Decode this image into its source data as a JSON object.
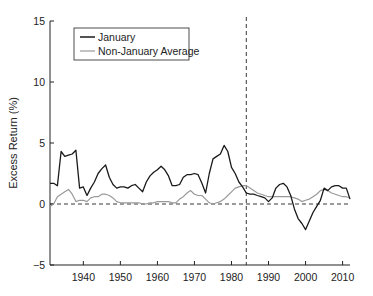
{
  "chart_data": {
    "type": "line",
    "title": "",
    "xlabel": "",
    "ylabel": "Excess Return (%)",
    "xlim": [
      1931,
      2012
    ],
    "ylim": [
      -5,
      15
    ],
    "xticks": [
      1940,
      1950,
      1960,
      1970,
      1980,
      1990,
      2000,
      2010
    ],
    "yticks": [
      -5,
      0,
      5,
      10,
      15
    ],
    "grid": false,
    "legend_position": "upper left",
    "reference_lines": [
      {
        "type": "horizontal",
        "value": 0,
        "style": "dashed"
      },
      {
        "type": "vertical",
        "value": 1984,
        "style": "dashed"
      }
    ],
    "series": [
      {
        "name": "January",
        "color": "#1a1a1a",
        "x": [
          1931,
          1932,
          1933,
          1934,
          1935,
          1936,
          1937,
          1938,
          1939,
          1940,
          1941,
          1942,
          1943,
          1944,
          1945,
          1946,
          1947,
          1948,
          1949,
          1950,
          1951,
          1952,
          1953,
          1954,
          1955,
          1956,
          1957,
          1958,
          1959,
          1960,
          1961,
          1962,
          1963,
          1964,
          1965,
          1966,
          1967,
          1968,
          1969,
          1970,
          1971,
          1972,
          1973,
          1974,
          1975,
          1976,
          1977,
          1978,
          1979,
          1980,
          1981,
          1982,
          1983,
          1984,
          1985,
          1986,
          1987,
          1988,
          1989,
          1990,
          1991,
          1992,
          1993,
          1994,
          1995,
          1996,
          1997,
          1998,
          1999,
          2000,
          2001,
          2002,
          2003,
          2004,
          2005,
          2006,
          2007,
          2008,
          2009,
          2010,
          2011,
          2012
        ],
        "values": [
          1.7,
          1.7,
          1.5,
          4.3,
          3.9,
          4.0,
          4.1,
          4.4,
          1.3,
          1.4,
          0.7,
          1.3,
          1.8,
          2.5,
          2.9,
          3.2,
          2.2,
          1.6,
          1.3,
          1.4,
          1.4,
          1.3,
          1.5,
          1.6,
          1.3,
          1.0,
          1.8,
          2.3,
          2.6,
          2.8,
          3.1,
          2.8,
          2.3,
          1.5,
          1.5,
          1.6,
          2.2,
          2.4,
          2.4,
          2.5,
          2.4,
          1.7,
          0.9,
          2.5,
          3.7,
          3.9,
          4.1,
          4.8,
          4.3,
          3.0,
          2.5,
          1.8,
          1.4,
          0.9,
          0.8,
          0.8,
          0.7,
          0.6,
          0.5,
          0.2,
          0.5,
          1.3,
          1.6,
          1.7,
          1.4,
          0.7,
          -0.4,
          -1.2,
          -1.6,
          -2.1,
          -1.4,
          -0.7,
          -0.2,
          0.3,
          1.3,
          1.1,
          1.4,
          1.5,
          1.5,
          1.3,
          1.3,
          0.4
        ]
      },
      {
        "name": "Non-January Average",
        "color": "#999999",
        "x": [
          1931,
          1932,
          1933,
          1934,
          1935,
          1936,
          1937,
          1938,
          1939,
          1940,
          1941,
          1942,
          1943,
          1944,
          1945,
          1946,
          1947,
          1948,
          1949,
          1950,
          1951,
          1952,
          1953,
          1954,
          1955,
          1956,
          1957,
          1958,
          1959,
          1960,
          1961,
          1962,
          1963,
          1964,
          1965,
          1966,
          1967,
          1968,
          1969,
          1970,
          1971,
          1972,
          1973,
          1974,
          1975,
          1976,
          1977,
          1978,
          1979,
          1980,
          1981,
          1982,
          1983,
          1984,
          1985,
          1986,
          1987,
          1988,
          1989,
          1990,
          1991,
          1992,
          1993,
          1994,
          1995,
          1996,
          1997,
          1998,
          1999,
          2000,
          2001,
          2002,
          2003,
          2004,
          2005,
          2006,
          2007,
          2008,
          2009,
          2010,
          2011,
          2012
        ],
        "values": [
          -0.2,
          0.0,
          0.6,
          0.8,
          1.0,
          1.2,
          0.8,
          0.2,
          0.3,
          0.3,
          0.2,
          0.5,
          0.6,
          0.6,
          0.8,
          0.8,
          0.7,
          0.5,
          0.2,
          0.1,
          0.1,
          0.1,
          0.1,
          0.1,
          0.1,
          0.0,
          0.0,
          0.1,
          0.1,
          0.2,
          0.2,
          0.2,
          0.2,
          0.1,
          0.1,
          0.4,
          0.6,
          0.9,
          1.1,
          0.8,
          0.7,
          0.7,
          0.4,
          0.1,
          0.0,
          0.1,
          0.2,
          0.4,
          0.7,
          1.0,
          1.3,
          1.4,
          1.5,
          1.5,
          1.3,
          1.1,
          0.9,
          0.8,
          0.7,
          0.6,
          0.6,
          0.6,
          0.6,
          0.6,
          0.6,
          0.6,
          0.5,
          0.4,
          0.2,
          0.3,
          0.4,
          0.6,
          0.8,
          1.1,
          1.2,
          1.1,
          0.9,
          0.8,
          0.7,
          0.6,
          0.6,
          0.5
        ]
      }
    ]
  },
  "legend": {
    "items": [
      {
        "label": "January",
        "color": "#1a1a1a"
      },
      {
        "label": "Non-January Average",
        "color": "#999999"
      }
    ]
  },
  "axes": {
    "y_title": "Excess Return (%)",
    "y_tick_labels": [
      "15",
      "10",
      "5",
      "0",
      "−5"
    ],
    "x_tick_labels": [
      "1940",
      "1950",
      "1960",
      "1970",
      "1980",
      "1990",
      "2000",
      "2010"
    ]
  }
}
